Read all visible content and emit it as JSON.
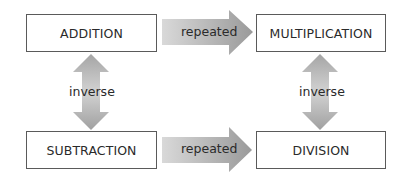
{
  "diagram": {
    "nodes": {
      "addition": "ADDITION",
      "multiplication": "MULTIPLICATION",
      "subtraction": "SUBTRACTION",
      "division": "DIVISION"
    },
    "edges": [
      {
        "from": "addition",
        "to": "multiplication",
        "label": "repeated",
        "direction": "right"
      },
      {
        "from": "subtraction",
        "to": "division",
        "label": "repeated",
        "direction": "right"
      },
      {
        "from": "addition",
        "to": "subtraction",
        "label": "inverse",
        "direction": "both"
      },
      {
        "from": "multiplication",
        "to": "division",
        "label": "inverse",
        "direction": "both"
      }
    ],
    "colors": {
      "arrow_light": "#d6d6d6",
      "arrow_dark": "#9a9a9a",
      "box_border": "#5a5a5a",
      "text": "#2a2a2a"
    }
  }
}
